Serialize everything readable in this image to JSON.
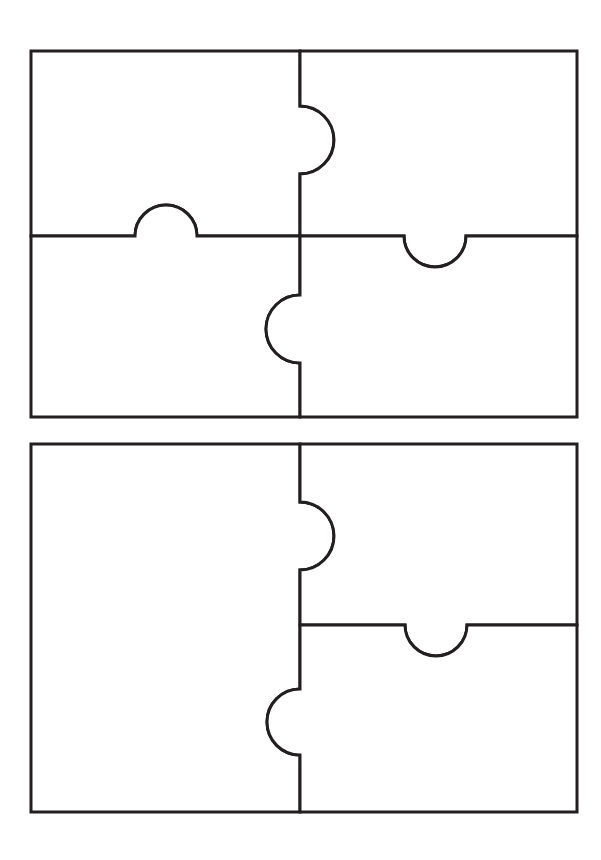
{
  "document": {
    "title": "Jigsaw Puzzle Template Worksheet",
    "caption": "",
    "page_width": 601,
    "page_height": 860,
    "background_color": "#ffffff",
    "line_color": "#231f20",
    "line_width": 3,
    "fill_color": "#ffffff"
  },
  "puzzles": [
    {
      "id": "puzzle-top",
      "label": "",
      "piece_count": 4,
      "bounds": {
        "x": 31,
        "y": 51,
        "width": 546,
        "height": 366
      },
      "grid": {
        "columns": 2,
        "rows": 2,
        "divider_x": 300,
        "divider_y": 236
      },
      "pieces": [
        {
          "id": "piece-top-left",
          "label": "",
          "position": "top-left",
          "bounds": {
            "x": 31,
            "y": 51,
            "width": 269,
            "height": 185
          },
          "connectors": [
            {
              "edge": "right",
              "type": "blank",
              "center": 140,
              "radius": 34
            },
            {
              "edge": "bottom",
              "type": "tab",
              "center": 166,
              "radius": 31
            }
          ]
        },
        {
          "id": "piece-top-right",
          "label": "",
          "position": "top-right",
          "bounds": {
            "x": 300,
            "y": 51,
            "width": 277,
            "height": 185
          },
          "connectors": [
            {
              "edge": "left",
              "type": "tab",
              "center": 140,
              "radius": 34
            },
            {
              "edge": "bottom",
              "type": "blank",
              "center": 435,
              "radius": 31
            }
          ]
        },
        {
          "id": "piece-bottom-left",
          "label": "",
          "position": "bottom-left",
          "bounds": {
            "x": 31,
            "y": 236,
            "width": 269,
            "height": 181
          },
          "connectors": [
            {
              "edge": "top",
              "type": "blank",
              "center": 166,
              "radius": 31
            },
            {
              "edge": "right",
              "type": "tab",
              "center": 329,
              "radius": 34
            }
          ]
        },
        {
          "id": "piece-bottom-right",
          "label": "",
          "position": "bottom-right",
          "bounds": {
            "x": 300,
            "y": 236,
            "width": 277,
            "height": 181
          },
          "connectors": [
            {
              "edge": "top",
              "type": "tab",
              "center": 435,
              "radius": 31
            },
            {
              "edge": "left",
              "type": "blank",
              "center": 329,
              "radius": 34
            }
          ]
        }
      ]
    },
    {
      "id": "puzzle-bottom",
      "label": "",
      "piece_count": 3,
      "bounds": {
        "x": 31,
        "y": 444,
        "width": 546,
        "height": 368
      },
      "grid": {
        "columns": 2,
        "rows": 2,
        "divider_x": 300,
        "divider_y": 625
      },
      "pieces": [
        {
          "id": "piece-left-tall",
          "label": "",
          "position": "left-full-height",
          "bounds": {
            "x": 31,
            "y": 444,
            "width": 269,
            "height": 368
          },
          "connectors": [
            {
              "edge": "right-upper",
              "type": "blank",
              "center": 536,
              "radius": 34
            },
            {
              "edge": "right-lower",
              "type": "tab",
              "center": 722,
              "radius": 33
            }
          ]
        },
        {
          "id": "piece-right-top",
          "label": "",
          "position": "right-top",
          "bounds": {
            "x": 300,
            "y": 444,
            "width": 277,
            "height": 181
          },
          "connectors": [
            {
              "edge": "left",
              "type": "tab",
              "center": 536,
              "radius": 34
            },
            {
              "edge": "bottom",
              "type": "blank",
              "center": 436,
              "radius": 31
            }
          ]
        },
        {
          "id": "piece-right-bottom",
          "label": "",
          "position": "right-bottom",
          "bounds": {
            "x": 300,
            "y": 625,
            "width": 277,
            "height": 187
          },
          "connectors": [
            {
              "edge": "top",
              "type": "tab",
              "center": 436,
              "radius": 31
            },
            {
              "edge": "left",
              "type": "blank",
              "center": 722,
              "radius": 33
            }
          ]
        }
      ]
    }
  ],
  "geometry": {
    "top_puzzle": {
      "piece_top_left_path": "M 31 51 L 300 51 L 300 106 A 34 34 0 0 1 300 174 L 300 236 L 197 236 A 31 31 0 0 0 135 236 L 31 236 Z",
      "piece_top_right_path": "M 300 51 L 577 51 L 577 236 L 466 236 A 31 31 0 0 1 404 236 L 300 236 L 300 174 A 34 34 0 0 0 300 106 Z",
      "piece_bottom_left_path": "M 31 236 L 135 236 A 31 31 0 0 1 197 236 L 300 236 L 300 295 A 34 34 0 0 0 300 363 L 300 417 L 31 417 Z",
      "piece_bottom_right_path": "M 300 236 L 404 236 A 31 31 0 0 0 466 236 L 577 236 L 577 417 L 300 417 L 300 363 A 34 34 0 0 1 300 295 Z"
    },
    "bottom_puzzle": {
      "piece_left_tall_path": "M 31 444 L 300 444 L 300 502 A 34 34 0 0 1 300 570 L 300 689 A 33 33 0 0 0 300 755 L 300 812 L 31 812 Z",
      "piece_right_top_path": "M 300 444 L 577 444 L 577 625 L 467 625 A 31 31 0 0 1 405 625 L 300 625 L 300 570 A 34 34 0 0 0 300 502 Z",
      "piece_right_bottom_path": "M 300 625 L 405 625 A 31 31 0 0 0 467 625 L 577 625 L 577 812 L 300 812 L 300 755 A 33 33 0 0 1 300 689 Z"
    }
  }
}
